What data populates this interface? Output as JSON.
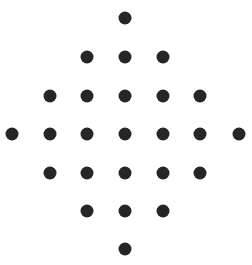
{
  "figure": {
    "width": 252,
    "height": 265,
    "background_color": "#ffffff",
    "dot_color": "#262626",
    "dot_diameter": 13,
    "total_dots": 25,
    "row_counts": [
      1,
      3,
      5,
      7,
      5,
      3,
      1
    ],
    "column_x": [
      12,
      50,
      87,
      125,
      163,
      200,
      239
    ],
    "row_y": [
      18,
      57,
      96,
      134,
      173,
      211,
      249
    ],
    "rows": [
      {
        "index": 0,
        "count": 1,
        "y": 18,
        "x": [
          125
        ]
      },
      {
        "index": 1,
        "count": 3,
        "y": 57,
        "x": [
          87,
          125,
          163
        ]
      },
      {
        "index": 2,
        "count": 5,
        "y": 96,
        "x": [
          50,
          87,
          125,
          163,
          200
        ]
      },
      {
        "index": 3,
        "count": 7,
        "y": 134,
        "x": [
          12,
          50,
          87,
          125,
          163,
          200,
          239
        ]
      },
      {
        "index": 4,
        "count": 5,
        "y": 173,
        "x": [
          50,
          87,
          125,
          163,
          200
        ]
      },
      {
        "index": 5,
        "count": 3,
        "y": 211,
        "x": [
          87,
          125,
          163
        ]
      },
      {
        "index": 6,
        "count": 1,
        "y": 249,
        "x": [
          125
        ]
      }
    ]
  }
}
